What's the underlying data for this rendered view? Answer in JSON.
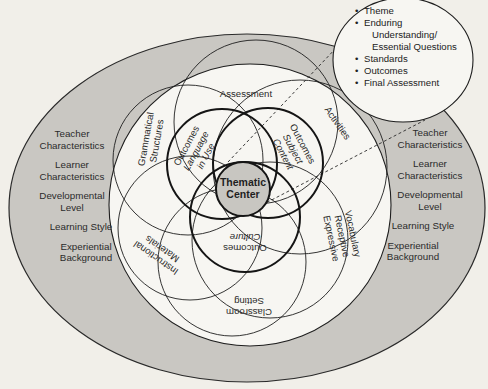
{
  "diagram": {
    "center": {
      "line1": "Thematic",
      "line2": "Center"
    },
    "outcomes": {
      "language": {
        "line1": "Outcomes",
        "line2": "Language",
        "line3": "in Use"
      },
      "subject": {
        "line1": "Outcomes",
        "line2": "Subject",
        "line3": "Content"
      },
      "culture": {
        "line1": "Outcomes",
        "line2": "Culture"
      }
    },
    "petals": {
      "assessment": "Assessment",
      "activities": "Activities",
      "vocabulary": {
        "line1": "Vocabulary",
        "line2": "Receptive",
        "line3": "Expressive"
      },
      "classroom": {
        "line1": "Classroom",
        "line2": "Setting"
      },
      "materials": {
        "line1": "Instructional",
        "line2": "Materials"
      },
      "grammar": {
        "line1": "Grammatical",
        "line2": "Structures"
      }
    },
    "left_factors": [
      {
        "line1": "Teacher",
        "line2": "Characteristics"
      },
      {
        "line1": "Learner",
        "line2": "Characteristics"
      },
      {
        "line1": "Developmental",
        "line2": "Level"
      },
      {
        "line1": "Learning Style",
        "line2": ""
      },
      {
        "line1": "Experiential",
        "line2": "Background"
      }
    ],
    "right_factors": [
      {
        "line1": "Teacher",
        "line2": "Characteristics"
      },
      {
        "line1": "Learner",
        "line2": "Characteristics"
      },
      {
        "line1": "Developmental",
        "line2": "Level"
      },
      {
        "line1": "Learning Style",
        "line2": ""
      },
      {
        "line1": "Experiential",
        "line2": "Background"
      }
    ],
    "callout": {
      "items": [
        "Theme",
        "Enduring",
        "Standards",
        "Outcomes",
        "Final Assessment"
      ],
      "enduring_cont1": "Understanding/",
      "enduring_cont2": "Essential Questions"
    },
    "colors": {
      "background": "#f1efe9",
      "outer_ring": "#c9c7c2",
      "inner_fill": "#f7f6f2",
      "center_fill": "#c8c6c1",
      "stroke": "#1e1e1e"
    }
  }
}
